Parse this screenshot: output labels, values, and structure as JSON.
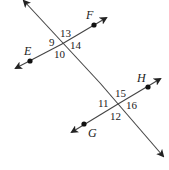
{
  "diagram": {
    "type": "parallel-lines-transversal",
    "colors": {
      "line": "#333333",
      "text": "#222222",
      "background": "#ffffff"
    },
    "points": {
      "E": "E",
      "F": "F",
      "G": "G",
      "H": "H"
    },
    "angles": {
      "a9": "9",
      "a10": "10",
      "a13": "13",
      "a14": "14",
      "a11": "11",
      "a12": "12",
      "a15": "15",
      "a16": "16"
    }
  }
}
